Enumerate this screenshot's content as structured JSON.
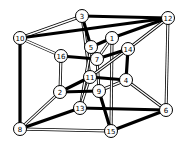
{
  "diagram": {
    "title": "",
    "nodes": [
      {
        "id": "3",
        "x": 82,
        "y": 16
      },
      {
        "id": "12",
        "x": 168,
        "y": 18
      },
      {
        "id": "10",
        "x": 20,
        "y": 38
      },
      {
        "id": "1",
        "x": 112,
        "y": 38
      },
      {
        "id": "5",
        "x": 91,
        "y": 47
      },
      {
        "id": "14",
        "x": 128,
        "y": 49
      },
      {
        "id": "16",
        "x": 61,
        "y": 56
      },
      {
        "id": "7",
        "x": 97,
        "y": 59
      },
      {
        "id": "11",
        "x": 90,
        "y": 77
      },
      {
        "id": "4",
        "x": 126,
        "y": 80
      },
      {
        "id": "2",
        "x": 60,
        "y": 92
      },
      {
        "id": "9",
        "x": 99,
        "y": 91
      },
      {
        "id": "13",
        "x": 80,
        "y": 108
      },
      {
        "id": "6",
        "x": 166,
        "y": 110
      },
      {
        "id": "8",
        "x": 20,
        "y": 129
      },
      {
        "id": "15",
        "x": 111,
        "y": 131
      }
    ],
    "edges_thick": [
      [
        "3",
        "12"
      ],
      [
        "10",
        "12"
      ],
      [
        "10",
        "8"
      ],
      [
        "3",
        "5"
      ],
      [
        "12",
        "1"
      ],
      [
        "16",
        "7"
      ],
      [
        "7",
        "14"
      ],
      [
        "14",
        "4"
      ],
      [
        "11",
        "4"
      ],
      [
        "2",
        "9"
      ],
      [
        "2",
        "11"
      ],
      [
        "9",
        "15"
      ],
      [
        "13",
        "8"
      ],
      [
        "13",
        "6"
      ],
      [
        "6",
        "15"
      ],
      [
        "5",
        "1"
      ]
    ],
    "edges_double": [
      [
        "10",
        "3"
      ],
      [
        "10",
        "16"
      ],
      [
        "12",
        "14"
      ],
      [
        "12",
        "6"
      ],
      [
        "5",
        "7"
      ],
      [
        "1",
        "7"
      ],
      [
        "16",
        "2"
      ],
      [
        "9",
        "4"
      ],
      [
        "8",
        "15"
      ],
      [
        "8",
        "2"
      ],
      [
        "4",
        "6"
      ],
      [
        "1",
        "15"
      ],
      [
        "3",
        "11"
      ],
      [
        "5",
        "13"
      ],
      [
        "7",
        "9"
      ],
      [
        "14",
        "11"
      ],
      [
        "11",
        "13"
      ]
    ]
  }
}
